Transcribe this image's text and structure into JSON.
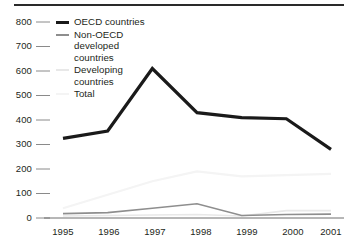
{
  "chart_data": {
    "type": "line",
    "title": "",
    "xlabel": "",
    "ylabel": "",
    "categories": [
      "1995",
      "1996",
      "1997",
      "1998",
      "1999",
      "2000",
      "2001"
    ],
    "ylim": [
      0,
      800
    ],
    "yticks": [
      0,
      100,
      200,
      300,
      400,
      500,
      600,
      700,
      800
    ],
    "grid": false,
    "legend_position": "top-left-inside",
    "series": [
      {
        "name": "OECD countries",
        "color": "#1a1a1a",
        "width": 3.2,
        "values": [
          325,
          355,
          610,
          430,
          410,
          405,
          280
        ]
      },
      {
        "name": "Non-OECD developed countries",
        "color": "#8e8e8e",
        "width": 1.6,
        "values": [
          18,
          22,
          40,
          58,
          10,
          14,
          16
        ]
      },
      {
        "name": "Developing countries",
        "color": "#e8e8e8",
        "width": 1.6,
        "values": [
          8,
          10,
          12,
          14,
          8,
          30,
          30
        ]
      },
      {
        "name": "Total",
        "color": "#f4f4f4",
        "width": 2.2,
        "values": [
          40,
          95,
          150,
          190,
          170,
          175,
          180
        ]
      }
    ]
  },
  "axis": {
    "y_tick_labels": [
      "800",
      "700",
      "600",
      "500",
      "400",
      "300",
      "200",
      "100",
      "0"
    ],
    "x_tick_labels": [
      "1995",
      "1996",
      "1997",
      "1998",
      "1999",
      "2000",
      "2001"
    ]
  },
  "legend": {
    "items": [
      {
        "label": "OECD countries"
      },
      {
        "label": "Non-OECD\ndeveloped\ncountries"
      },
      {
        "label": "Developing\ncountries"
      },
      {
        "label": "Total"
      }
    ]
  }
}
